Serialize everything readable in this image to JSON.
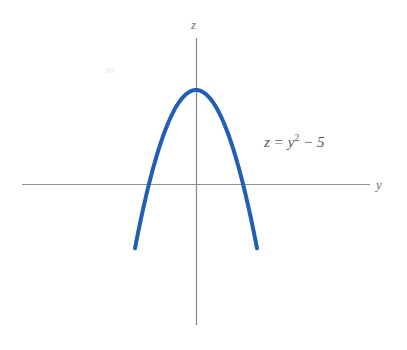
{
  "figure": {
    "background_color": "#ffffff",
    "width": 407,
    "height": 350
  },
  "axes": {
    "vertical_label": "z",
    "horizontal_label": "y",
    "color": "#8c8c8c",
    "origin": {
      "x": 196,
      "y": 184
    },
    "vertical_extent": {
      "top": 38,
      "bottom": 325
    },
    "horizontal_extent": {
      "left": 22,
      "right": 370
    }
  },
  "annotation": {
    "equation_lhs": "z",
    "equation_equals": "=",
    "equation_variable": "y",
    "equation_exponent": "2",
    "equation_minus": "−",
    "equation_constant": "5",
    "equation_full": "z = y² − 5",
    "color": "#56565a"
  },
  "chart_data": {
    "type": "line",
    "title": "",
    "xlabel": "y",
    "ylabel": "z",
    "grid": false,
    "legend": null,
    "curve_color": "#1f5fb4",
    "curve_width": 4,
    "function": "z = y^2 - 5",
    "vertex": {
      "y": 0,
      "z": -5
    },
    "roots": [
      -2.236,
      2.236
    ],
    "xlim": [
      -3.5,
      3.5
    ],
    "ylim": [
      -6.5,
      9.5
    ],
    "x": [
      -2.8,
      -2.4,
      -2.0,
      -1.6,
      -1.2,
      -0.8,
      -0.4,
      0.0,
      0.4,
      0.8,
      1.2,
      1.6,
      2.0,
      2.4,
      2.8
    ],
    "values": [
      2.84,
      0.76,
      -1.0,
      -2.44,
      -3.56,
      -4.36,
      -4.84,
      -5.0,
      -4.84,
      -4.36,
      -3.56,
      -2.44,
      -1.0,
      0.76,
      2.84
    ],
    "annotations": [
      {
        "text": "z = y² − 5",
        "x": 3.0,
        "z": 6.4
      }
    ],
    "pixel_path": {
      "vertex_px": {
        "x": 196,
        "y": 278
      },
      "left_end_px": {
        "x": 135,
        "y": 131
      },
      "right_end_px": {
        "x": 257,
        "y": 131
      },
      "roots_px": [
        155,
        243
      ]
    }
  }
}
